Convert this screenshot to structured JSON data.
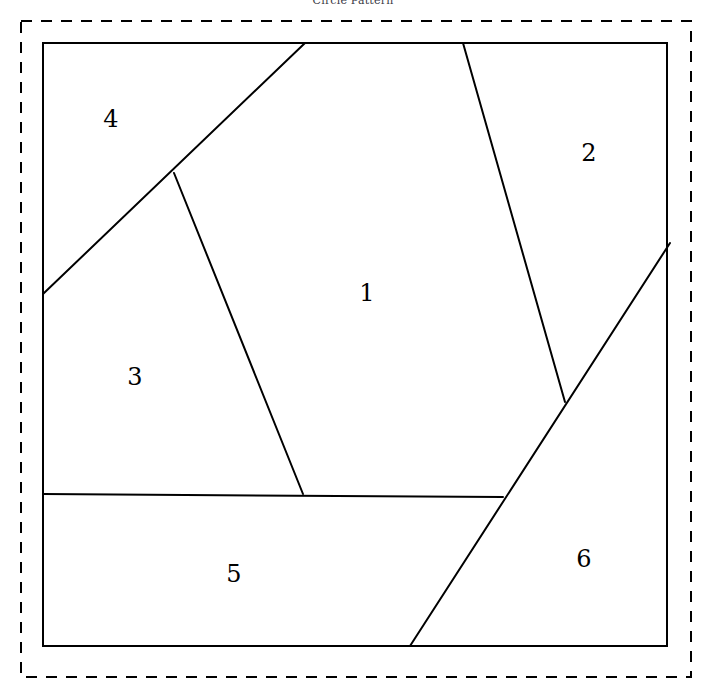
{
  "figure": {
    "title": "Circle Pattern",
    "width": 706,
    "height": 695,
    "background_color": "#ffffff",
    "stroke_color": "#000000",
    "title_color": "#3a3a46"
  },
  "outer_boundary": {
    "name": "dashed-bounding-box",
    "style": "dashed",
    "x": 21,
    "y": 21,
    "width": 670,
    "height": 656,
    "stroke_width": 2,
    "dash_pattern": "11 9"
  },
  "inner_boundary": {
    "name": "solid-quadrilateral-frame",
    "style": "solid",
    "stroke_width": 2,
    "points": "43,43 667,43 667,646 43,646"
  },
  "partition_lines": [
    {
      "name": "line-region4-divider",
      "from_x": 43,
      "from_y": 294,
      "to_x": 305,
      "to_y": 43
    },
    {
      "name": "line-region3-region1-divider",
      "from_x": 174,
      "from_y": 173,
      "to_x": 303,
      "to_y": 494
    },
    {
      "name": "line-region1-region2-divider",
      "from_x": 463,
      "from_y": 43,
      "to_x": 565,
      "to_y": 402
    },
    {
      "name": "line-region5-horizontal-divider",
      "from_x": 43,
      "from_y": 494,
      "to_x": 503,
      "to_y": 497
    },
    {
      "name": "line-region6-long-diagonal",
      "from_x": 410,
      "from_y": 646,
      "to_x": 670,
      "to_y": 243
    }
  ],
  "regions": [
    {
      "name": "region-1",
      "label": "1",
      "cx": 367,
      "cy": 294
    },
    {
      "name": "region-2",
      "label": "2",
      "cx": 589,
      "cy": 154
    },
    {
      "name": "region-3",
      "label": "3",
      "cx": 135,
      "cy": 378
    },
    {
      "name": "region-4",
      "label": "4",
      "cx": 111,
      "cy": 120
    },
    {
      "name": "region-5",
      "label": "5",
      "cx": 234,
      "cy": 575
    },
    {
      "name": "region-6",
      "label": "6",
      "cx": 584,
      "cy": 560
    }
  ]
}
